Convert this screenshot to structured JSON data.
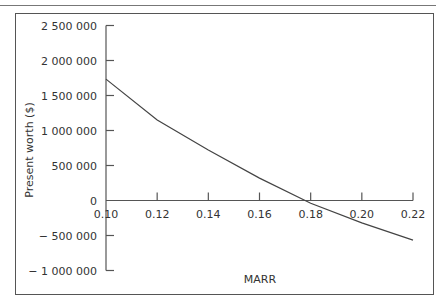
{
  "chart_data": {
    "type": "line",
    "title": "",
    "xlabel": "MARR",
    "ylabel": "Present worth ($)",
    "xlim": [
      0.1,
      0.22
    ],
    "ylim": [
      -1000000,
      2500000
    ],
    "x_ticks": [
      "0.10",
      "0.12",
      "0.14",
      "0.16",
      "0.18",
      "0.20",
      "0.22"
    ],
    "y_ticks": [
      "2 500 000",
      "2 000 000",
      "1 500 000",
      "1 000 000",
      "500 000",
      "0",
      "− 500 000",
      "− 1 000 000"
    ],
    "grid": false,
    "legend": null,
    "series": [
      {
        "name": "Present worth",
        "x": [
          0.1,
          0.12,
          0.14,
          0.16,
          0.18,
          0.2,
          0.22
        ],
        "y": [
          1735000,
          1150000,
          720000,
          320000,
          -40000,
          -320000,
          -565000
        ]
      }
    ]
  }
}
